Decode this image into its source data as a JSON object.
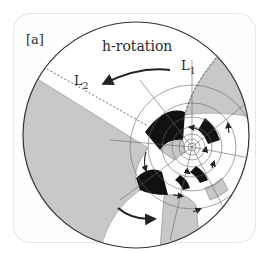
{
  "figure": {
    "panel_label": "[a]",
    "title": "h-rotation",
    "line_labels": [
      {
        "name": "L",
        "subscript": "1"
      },
      {
        "name": "L",
        "subscript": "2"
      }
    ],
    "colors": {
      "black": "#111111",
      "gray": "#c8c8c8",
      "white": "#ffffff",
      "outline": "#333333",
      "frame": "#cfcfcf"
    }
  }
}
